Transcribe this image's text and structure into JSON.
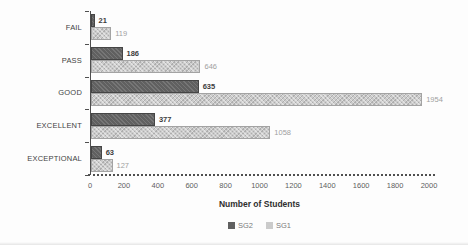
{
  "chart_data": {
    "type": "bar",
    "orientation": "horizontal",
    "title": "",
    "xlabel": "Number of Students",
    "ylabel": "",
    "categories": [
      "FAIL",
      "PASS",
      "GOOD",
      "EXCELLENT",
      "EXCEPTIONAL"
    ],
    "series": [
      {
        "name": "SG2",
        "values": [
          21,
          186,
          635,
          377,
          63
        ],
        "color": "#606060",
        "label_color": "#3c3c3c"
      },
      {
        "name": "SG1",
        "values": [
          119,
          646,
          1954,
          1058,
          127
        ],
        "color": "#cbcbcb",
        "label_color": "#9f9f9f"
      }
    ],
    "xlim": [
      0,
      2000
    ],
    "xticks": [
      0,
      200,
      400,
      600,
      800,
      1000,
      1200,
      1400,
      1600,
      1800,
      2000
    ],
    "grid": false,
    "legend_position": "bottom",
    "axis_color": "#4f4f4f"
  }
}
